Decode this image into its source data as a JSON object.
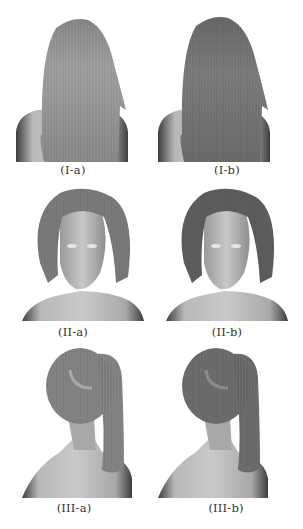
{
  "figure": {
    "rows": [
      {
        "id": "I",
        "view": "back-long-hair",
        "panels": [
          {
            "caption": "(I-a)",
            "variant": "a",
            "hair_shade": "#8c8c8c"
          },
          {
            "caption": "(I-b)",
            "variant": "b",
            "hair_shade": "#747474"
          }
        ]
      },
      {
        "id": "II",
        "view": "front-short-hair-face",
        "panels": [
          {
            "caption": "(II-a)",
            "variant": "a",
            "hair_shade": "#7c7c7c"
          },
          {
            "caption": "(II-b)",
            "variant": "b",
            "hair_shade": "#5e5e5e"
          }
        ]
      },
      {
        "id": "III",
        "view": "back-ponytail",
        "panels": [
          {
            "caption": "(III-a)",
            "variant": "a",
            "hair_shade": "#858585"
          },
          {
            "caption": "(III-b)",
            "variant": "b",
            "hair_shade": "#6e6e6e"
          }
        ]
      }
    ],
    "colors": {
      "background": "#ffffff",
      "skin": "#b5b5b5",
      "skin_shadow": "#4a4a4a",
      "caption_text": "#333333"
    }
  }
}
